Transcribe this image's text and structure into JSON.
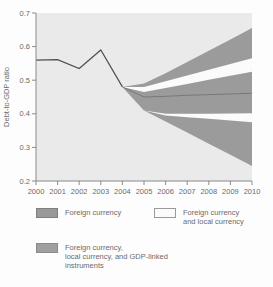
{
  "chart_data": {
    "type": "area",
    "title": "",
    "xlabel": "",
    "ylabel": "Debt-to-GDP ratio",
    "ylim": [
      0.2,
      0.7
    ],
    "yticks": [
      "0.7",
      "0.6",
      "0.5",
      "0.4",
      "0.3",
      "0.2"
    ],
    "ytick_values": [
      0.7,
      0.6,
      0.5,
      0.4,
      0.3,
      0.2
    ],
    "xticks": [
      "2000",
      "2001",
      "2002",
      "2003",
      "2004",
      "2005",
      "2006",
      "2007",
      "2008",
      "2009",
      "2010"
    ],
    "xtick_values": [
      2000,
      2001,
      2002,
      2003,
      2004,
      2005,
      2006,
      2007,
      2008,
      2009,
      2010
    ],
    "xlim": [
      2000,
      2010
    ],
    "grid": false,
    "legend_position": "bottom",
    "historical_line": {
      "x": [
        2000,
        2001,
        2002,
        2003,
        2004
      ],
      "y": [
        0.56,
        0.561,
        0.535,
        0.59,
        0.48
      ]
    },
    "projection_years": [
      2004,
      2005,
      2006,
      2007,
      2008,
      2009,
      2010
    ],
    "bands": [
      {
        "name": "Foreign currency",
        "color": "#9b9b9b",
        "top": [
          0.48,
          0.49,
          0.521,
          0.554,
          0.588,
          0.621,
          0.655
        ],
        "bottom": [
          0.48,
          0.41,
          0.377,
          0.344,
          0.311,
          0.278,
          0.245
        ]
      },
      {
        "name": "Foreign currency and local currency",
        "color": "#fbfbfb",
        "top": [
          0.48,
          0.48,
          0.497,
          0.514,
          0.531,
          0.548,
          0.565
        ],
        "bottom": [
          0.48,
          0.41,
          0.395,
          0.39,
          0.385,
          0.38,
          0.375
        ]
      },
      {
        "name": "Foreign currency, local currency, and GDP-linked instruments",
        "color": "#9b9b9b",
        "top": [
          0.48,
          0.465,
          0.477,
          0.489,
          0.501,
          0.513,
          0.525
        ],
        "bottom": [
          0.48,
          0.41,
          0.4,
          0.4,
          0.4,
          0.401,
          0.402
        ]
      }
    ],
    "baseline": {
      "x": [
        2004,
        2005,
        2006,
        2007,
        2008,
        2009,
        2010
      ],
      "y": [
        0.48,
        0.45,
        0.452,
        0.455,
        0.457,
        0.459,
        0.461
      ]
    }
  },
  "legend": {
    "items": [
      {
        "lines": [
          "Foreign currency"
        ]
      },
      {
        "lines": [
          "Foreign currency",
          "and local currency"
        ]
      },
      {
        "lines": [
          "Foreign currency,",
          "local currency, and GDP-linked",
          "instruments"
        ]
      }
    ]
  },
  "colors": {
    "plot_background": "#eaeaea",
    "band_gray": "#9b9b9b",
    "band_white": "#fbfbfb",
    "historical_line": "#4f4f4f",
    "baseline": "#6f6f6f",
    "axis": "#8a8a8a",
    "text": "#6b6b6b"
  }
}
